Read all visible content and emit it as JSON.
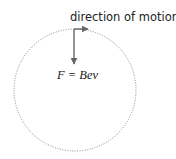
{
  "diagram": {
    "motion_label": "direction of motion",
    "force_label": "F = Bev",
    "circle": {
      "cx": 75,
      "cy": 90,
      "r": 61,
      "style": "dotted",
      "color": "#8a8a8a"
    },
    "arrow_color": "#666666",
    "velocity_arrow": {
      "from": [
        74,
        29
      ],
      "to": [
        88,
        29
      ]
    },
    "force_arrow": {
      "from": [
        74,
        29
      ],
      "to": [
        74,
        64
      ]
    }
  }
}
